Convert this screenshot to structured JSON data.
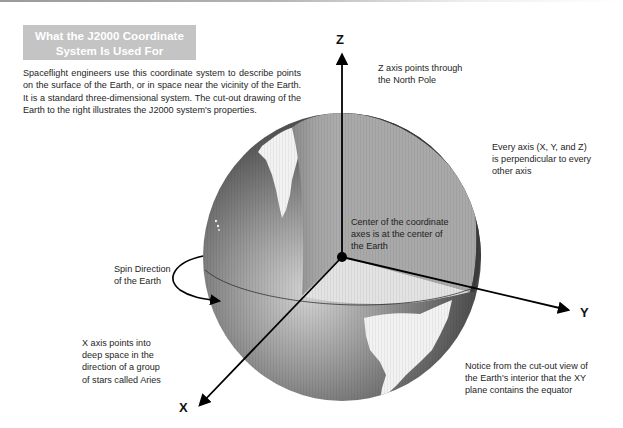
{
  "title": {
    "line1": "What the J2000 Coordinate",
    "line2": "System Is Used For"
  },
  "intro": "Spaceflight engineers use this coordinate system to describe points on the surface of the Earth, or in space near the vicinity of the Earth. It is a standard three-dimensional system. The cut-out drawing of the Earth to the right illustrates the J2000 system's properties.",
  "axes": {
    "z": "Z",
    "y": "Y",
    "x": "X"
  },
  "annotations": {
    "z_axis": [
      "Z axis points through",
      "the North  Pole"
    ],
    "perpendicular": [
      "Every axis (X, Y, and Z)",
      "is perpendicular to every",
      "other axis"
    ],
    "center": [
      "Center of the coordinate",
      "axes is at the center of",
      "the Earth"
    ],
    "spin": [
      "Spin Direction",
      "of the Earth"
    ],
    "x_axis": [
      "X axis points into",
      "deep space in the",
      "direction of a group",
      "of stars called Aries"
    ],
    "xy_plane": [
      "Notice from the cut-out view of",
      "the Earth's interior that the XY",
      "plane contains the equator"
    ]
  },
  "colors": {
    "title_bg": "#c4c4c4",
    "title_text": "#ffffff",
    "ocean_dark": "#3a3a3a",
    "ocean_light": "#c8c8c8",
    "land": "#f2f2f2",
    "cut_vertical": "#a6a6a6",
    "cut_vertical_dark": "#8a8a8a",
    "cut_equator": "#e4e4e4",
    "axis": "#000000"
  }
}
